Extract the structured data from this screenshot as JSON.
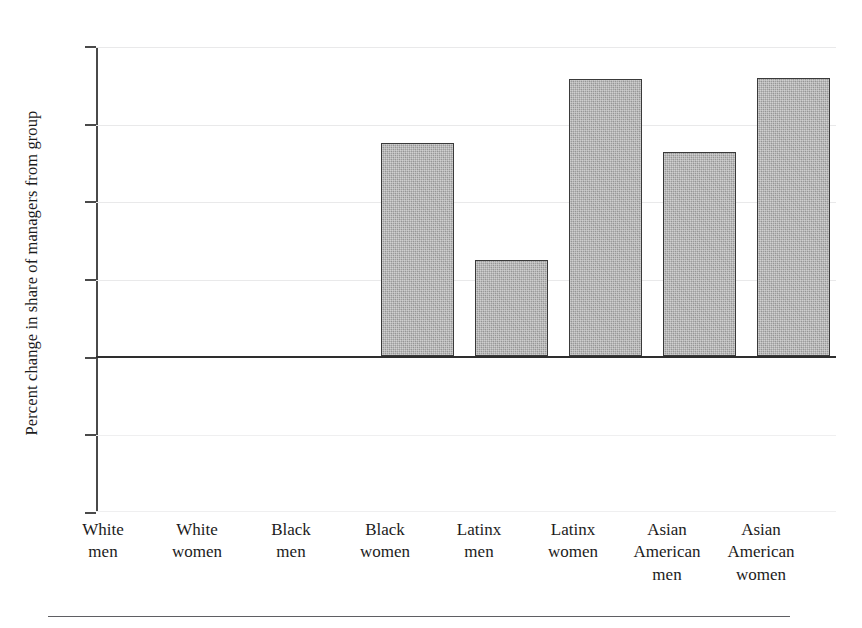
{
  "chart_data": {
    "type": "bar",
    "title": "",
    "subtitle": "",
    "xlabel": "",
    "ylabel": "Percent change in share of managers from group",
    "categories": [
      "White men",
      "White women",
      "Black men",
      "Black women",
      "Latinx men",
      "Latinx women",
      "Asian American men",
      "Asian American women"
    ],
    "category_lines": [
      [
        "White",
        "men"
      ],
      [
        "White",
        "women"
      ],
      [
        "Black",
        "men"
      ],
      [
        "Black",
        "women"
      ],
      [
        "Latinx",
        "men"
      ],
      [
        "Latinx",
        "women"
      ],
      [
        "Asian",
        "American",
        "men"
      ],
      [
        "Asian",
        "American",
        "women"
      ]
    ],
    "values": [
      0,
      0,
      0,
      13.8,
      6.2,
      17.9,
      13.2,
      18.0
    ],
    "ylim": [
      -10,
      20
    ],
    "yticks": [
      20,
      15,
      10,
      5,
      0,
      -5,
      -10
    ],
    "ytick_labels": [
      "20",
      "15",
      "10",
      "5",
      "0",
      "−5",
      "−10"
    ],
    "grid": true,
    "legend": "none",
    "bar_color": "#9d9d9d",
    "bar_edge_color": "#3a3a3a",
    "gridline_color": "#e9e9ea",
    "axis_color": "#4a4a4a",
    "zero_line_color": "#2e2e2e"
  }
}
